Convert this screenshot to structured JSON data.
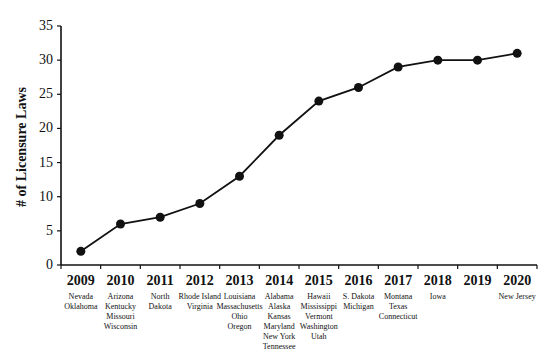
{
  "chart_data": {
    "type": "line",
    "title": "",
    "xlabel": "",
    "ylabel": "# of Licensure Laws",
    "ylim": [
      0,
      35
    ],
    "yticks": [
      0,
      5,
      10,
      15,
      20,
      25,
      30,
      35
    ],
    "grid": false,
    "legend": null,
    "categories": [
      "2009",
      "2010",
      "2011",
      "2012",
      "2013",
      "2014",
      "2015",
      "2016",
      "2017",
      "2018",
      "2019",
      "2020"
    ],
    "series": [
      {
        "name": "Cumulative licensure laws",
        "values": [
          2,
          6,
          7,
          9,
          13,
          19,
          24,
          26,
          29,
          30,
          30,
          31
        ]
      }
    ],
    "category_annotations": [
      {
        "year": "2009",
        "states": [
          "Nevada",
          "Oklahoma"
        ]
      },
      {
        "year": "2010",
        "states": [
          "Arizona",
          "Kentucky",
          "Missouri",
          "Wisconsin"
        ]
      },
      {
        "year": "2011",
        "states": [
          "North",
          "Dakota"
        ]
      },
      {
        "year": "2012",
        "states": [
          "Rhode Island",
          "Virginia"
        ]
      },
      {
        "year": "2013",
        "states": [
          "Louisiana",
          "Massachusetts",
          "Ohio",
          "Oregon"
        ]
      },
      {
        "year": "2014",
        "states": [
          "Alabama",
          "Alaska",
          "Kansas",
          "Maryland",
          "New York",
          "Tennessee"
        ]
      },
      {
        "year": "2015",
        "states": [
          "Hawaii",
          "Mississippi",
          "Vermont",
          "Washington",
          "Utah"
        ]
      },
      {
        "year": "2016",
        "states": [
          "S. Dakota",
          "Michigan"
        ]
      },
      {
        "year": "2017",
        "states": [
          "Montana",
          "Texas",
          "Connecticut"
        ]
      },
      {
        "year": "2018",
        "states": [
          "Iowa"
        ]
      },
      {
        "year": "2019",
        "states": []
      },
      {
        "year": "2020",
        "states": [
          "New Jersey"
        ]
      }
    ],
    "colors": {
      "line": "#111111",
      "marker": "#111111",
      "axis": "#111111"
    }
  }
}
